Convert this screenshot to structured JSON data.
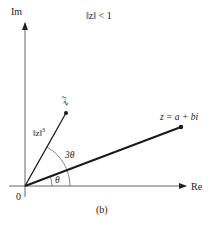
{
  "figure": {
    "title": "‖z‖ < 1",
    "caption": "(b)",
    "axes": {
      "imag_label": "Im",
      "real_label": "Re",
      "origin_label": "0"
    },
    "points": {
      "z": {
        "label": "z = a + bi"
      },
      "z_cubed": {
        "label_base": "z",
        "label_exp": "3"
      }
    },
    "magnitude_label": {
      "base": "‖z‖",
      "exp": "3"
    },
    "angles": {
      "theta": "θ",
      "three_theta": "3θ"
    },
    "colors": {
      "ink": "#222222",
      "axis": "#555555",
      "background": "#ffffff"
    }
  }
}
